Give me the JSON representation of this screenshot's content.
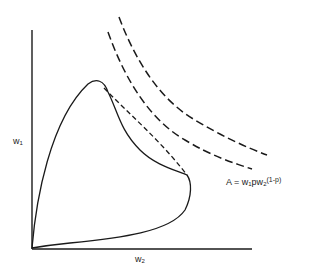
{
  "diagram": {
    "type": "economic feasible set with iso-utility curves",
    "axes": {
      "y_label": "w",
      "y_label_sub": "1",
      "x_label": "w",
      "x_label_sub": "2"
    },
    "formula": {
      "prefix": "A = w",
      "sub1": "1",
      "mid": "pw",
      "sub2": "2",
      "suffix": "(1-p)"
    },
    "colors": {
      "ink": "#1a1a1a",
      "background": "#ffffff"
    },
    "elements": [
      {
        "name": "feasible-set-boundary",
        "style": "solid",
        "description": "closed curve from origin, peaks near top-left, tip at right"
      },
      {
        "name": "tangent-line",
        "style": "short-dash",
        "description": "dashed segment connecting peak and right tip of feasible set"
      },
      {
        "name": "indifference-curve-inner",
        "style": "long-dash"
      },
      {
        "name": "indifference-curve-outer",
        "style": "long-dash"
      }
    ]
  }
}
